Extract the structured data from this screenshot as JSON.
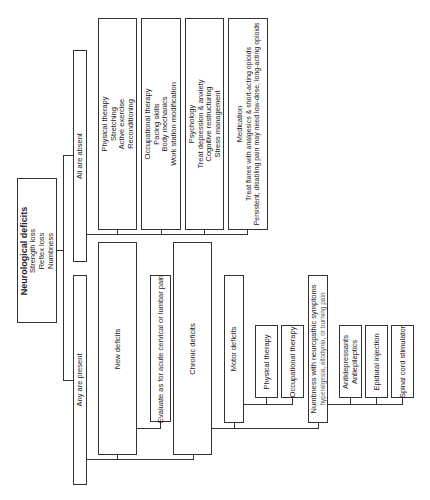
{
  "diagram": {
    "root": {
      "title": "Neurological deficits",
      "lines": [
        "Strength loss",
        "Reflex loss",
        "Numbness"
      ]
    },
    "branch_absent": {
      "label": "All are absent",
      "children": [
        {
          "title": "Physical therapy",
          "lines": [
            "Stretching",
            "Active exercise",
            "Reconditioning"
          ]
        },
        {
          "title": "Occupational therapy",
          "lines": [
            "Pacing skills",
            "Body mechanics",
            "Work station modification"
          ]
        },
        {
          "title": "Psychology",
          "lines": [
            "Treat depression & anxiety",
            "Cognitive restructuring",
            "Stress management"
          ]
        },
        {
          "title": "Medication",
          "lines": [
            "Treat flares with analgesics & short-acting opioids",
            "Persistent, disabling pain may need low-dose, long-acting opioids"
          ]
        }
      ]
    },
    "branch_present": {
      "label": "Any are present",
      "new_deficits": {
        "label": "New deficits",
        "child": "Evaluate as for acute cervical or lumbar pain"
      },
      "chronic_deficits": {
        "label": "Chronic deficits",
        "motor": {
          "label": "Motor deficits",
          "children": [
            "Physical therapy",
            "Occupational therapy"
          ]
        },
        "numbness": {
          "label": "Numbness with neuropathic symptoms",
          "sublabel": "hyperalgesia, allodynia, or burning pain",
          "children": [
            {
              "lines": [
                "Antidepressants",
                "Antiepileptics"
              ]
            },
            {
              "lines": [
                "Epidural injection"
              ]
            },
            {
              "lines": [
                "Spinal cord stimulator"
              ]
            }
          ]
        }
      }
    }
  }
}
